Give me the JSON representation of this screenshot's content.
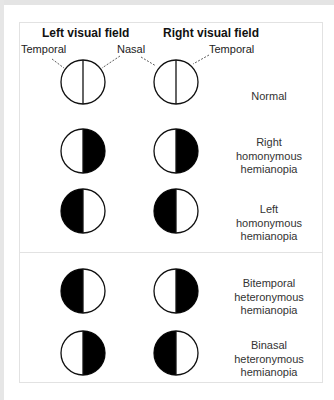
{
  "headers": {
    "left": "Left visual field",
    "right": "Right visual field"
  },
  "side_labels": {
    "left_temporal": "Temporal",
    "nasal": "Nasal",
    "right_temporal": "Temporal"
  },
  "rows": [
    {
      "label": [
        "Normal"
      ],
      "left_field": "none",
      "right_field": "none"
    },
    {
      "label": [
        "Right",
        "homonymous",
        "hemianopia"
      ],
      "left_field": "right-half-black",
      "right_field": "right-half-black"
    },
    {
      "label": [
        "Left",
        "homonymous",
        "hemianopia"
      ],
      "left_field": "left-half-black",
      "right_field": "left-half-black"
    },
    {
      "label": [
        "Bitemporal",
        "heteronymous",
        "hemianopia"
      ],
      "left_field": "left-half-black",
      "right_field": "right-half-black"
    },
    {
      "label": [
        "Binasal",
        "heteronymous",
        "hemianopia"
      ],
      "left_field": "right-half-black",
      "right_field": "left-half-black"
    }
  ],
  "colors": {
    "field_fill": "#000000",
    "field_outline": "#111111",
    "frame_border": "#e2e2e2"
  }
}
